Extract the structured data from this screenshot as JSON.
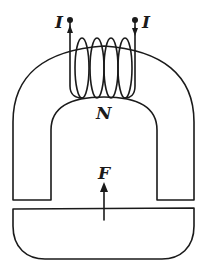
{
  "diagram": {
    "labels": {
      "current_left": "I",
      "current_right": "I",
      "turns": "N",
      "force": "F"
    },
    "components": [
      "yoke",
      "coil",
      "armature",
      "current-leads",
      "force-arrow"
    ],
    "colors": {
      "stroke": "#1a1a1a",
      "background": "#ffffff"
    }
  }
}
